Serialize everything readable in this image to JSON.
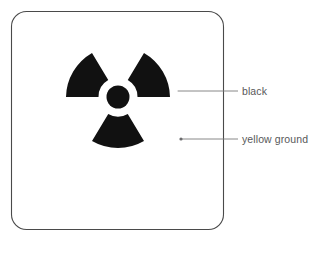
{
  "diagram": {
    "sign": {
      "name": "radiation-trefoil-sign",
      "shape": "rounded-square",
      "border_color": "#4a4a4a",
      "ground_color": "#ffffff",
      "symbol_color": "#111111",
      "bounds": {
        "x": 11,
        "y": 11,
        "width": 213,
        "height": 219,
        "radius": 15
      }
    },
    "symbol": {
      "name": "radiation-trefoil-icon",
      "center": {
        "x": 118,
        "y": 97
      },
      "inner_circle_radius": 11.5,
      "blade_inner_radius": 19.5,
      "blade_outer_radius": 52,
      "blade_count": 3,
      "blade_span_degrees": 60,
      "blade_gap_degrees": 60,
      "blade_start_angles": [
        120,
        240,
        0
      ]
    },
    "callouts": [
      {
        "id": "black",
        "label": "black",
        "target_color": "#111111",
        "marker": {
          "x": 176,
          "y": 91,
          "color": "#ffffff"
        },
        "line": {
          "x1": 176,
          "y1": 91,
          "x2": 238,
          "y2": 91
        },
        "label_position": {
          "x": 242,
          "y": 91
        }
      },
      {
        "id": "yellow-ground",
        "label": "yellow ground",
        "target_color": "#ffffff",
        "marker": {
          "x": 181,
          "y": 139,
          "color": "#6b6b6d"
        },
        "line": {
          "x1": 181,
          "y1": 139,
          "x2": 238,
          "y2": 139
        },
        "label_position": {
          "x": 242,
          "y": 139
        }
      }
    ],
    "styles": {
      "leader_line_color": "#7a7a7c",
      "leader_line_width": 0.9,
      "label_color": "#58585a",
      "border_width": 1.1
    }
  }
}
